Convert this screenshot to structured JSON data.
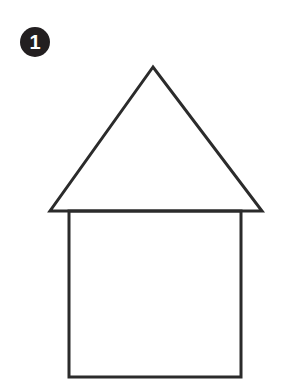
{
  "step": {
    "number": "1"
  },
  "drawing": {
    "subject": "house-outline",
    "stroke_color": "#2b2b2b",
    "background": "#ffffff",
    "roof": {
      "apex": [
        153,
        67
      ],
      "left": [
        50,
        211
      ],
      "right": [
        262,
        211
      ]
    },
    "body": {
      "x": 69,
      "y": 211,
      "width": 172,
      "height": 166
    }
  }
}
